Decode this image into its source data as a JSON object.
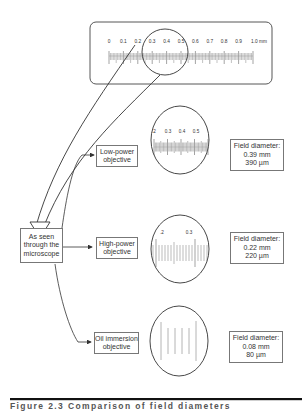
{
  "ruler": {
    "labels": [
      "0",
      "0.1",
      "0.2",
      "0.3",
      "0.4",
      "0.5",
      "0.6",
      "0.7",
      "0.8",
      "0.9",
      "1.0 mm"
    ]
  },
  "source": {
    "label_lines": [
      "As seen",
      "through the",
      "microscope"
    ]
  },
  "objectives": [
    {
      "name_lines": [
        "Low-power",
        "objective"
      ],
      "view_labels": [
        ".2",
        "0.3",
        "0.4",
        "0.5"
      ],
      "field": {
        "title": "Field diameter:",
        "mm": "0.39 mm",
        "um": "390 µm"
      }
    },
    {
      "name_lines": [
        "High-power",
        "objective"
      ],
      "view_labels": [
        ".2",
        "0.3"
      ],
      "field": {
        "title": "Field diameter:",
        "mm": "0.22 mm",
        "um": "220 µm"
      }
    },
    {
      "name_lines": [
        "Oil immersion",
        "objective"
      ],
      "view_labels": [],
      "field": {
        "title": "Field diameter:",
        "mm": "0.08 mm",
        "um": "80 µm"
      }
    }
  ],
  "caption": "Figure 2.3   Comparison of field diameters",
  "colors": {
    "line": "#333333",
    "box_border": "#777777",
    "rule": "#111111"
  }
}
